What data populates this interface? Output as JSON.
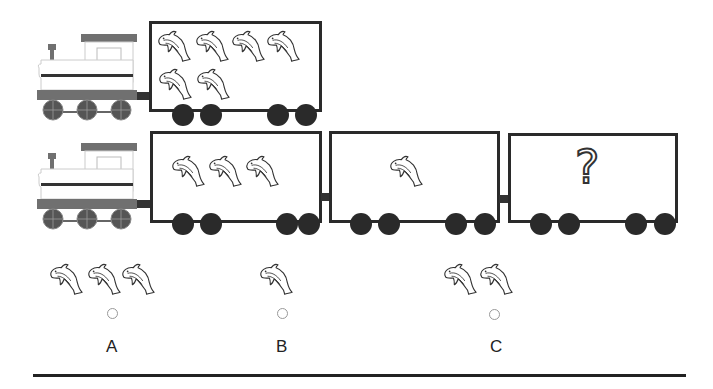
{
  "train1": {
    "cars": [
      {
        "dolphins": 6
      }
    ]
  },
  "train2": {
    "cars": [
      {
        "dolphins": 3
      },
      {
        "dolphins": 1
      },
      {
        "question_mark": "?"
      }
    ]
  },
  "options": [
    {
      "label": "A",
      "dolphins": 3
    },
    {
      "label": "B",
      "dolphins": 1
    },
    {
      "label": "C",
      "dolphins": 2
    }
  ],
  "colors": {
    "outline": "#2a2a2a",
    "loco_gray": "#707070",
    "wheel": "#2a2a2a"
  }
}
